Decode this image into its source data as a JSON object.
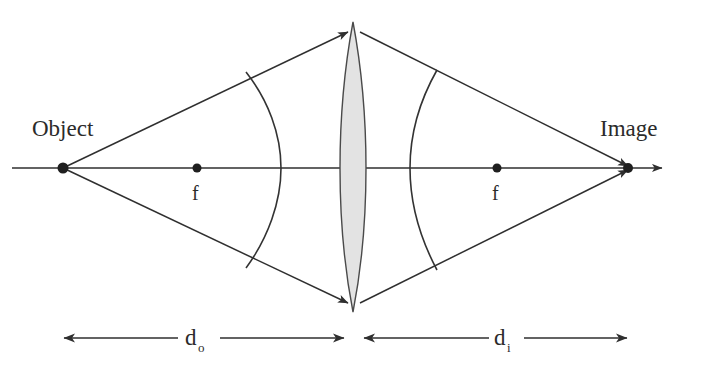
{
  "diagram": {
    "labels": {
      "object": "Object",
      "image": "Image",
      "focal_left": "f",
      "focal_right": "f",
      "object_distance": "d",
      "object_distance_sub": "o",
      "image_distance": "d",
      "image_distance_sub": "i"
    },
    "colors": {
      "background": "#ffffff",
      "ink": "#2f2f2f",
      "lens_fill": "#e3e3e3",
      "lens_stroke": "#4a4a4a",
      "text": "#2b2b2b"
    },
    "geometry": {
      "axis_y": 168,
      "object_x": 63,
      "focal_left_x": 197,
      "lens_center_x": 353,
      "focal_right_x": 497,
      "image_x": 628,
      "axis_arrow_end_x": 672,
      "lens_top_y": 22,
      "lens_bottom_y": 312,
      "lens_half_width": 13,
      "dimension_line_y": 338,
      "wavefront_left_axis_x": 281,
      "wavefront_right_axis_x": 413
    }
  }
}
